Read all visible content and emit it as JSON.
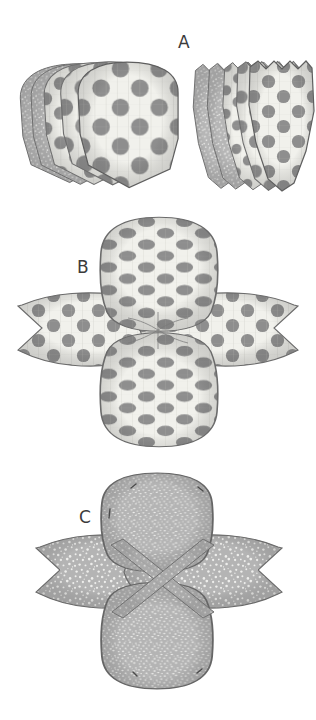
{
  "document": {
    "title": "Fabric Pattern Assembly Diagram",
    "type": "sewing instruction illustration",
    "background_color": "#ffffff",
    "width": 316,
    "height": 720
  },
  "palette": {
    "dot_gray": "#8e8e8e",
    "face_cream": "#f1f1ec",
    "face_outline": "#6f6f6f",
    "back_gray": "#b4b4b4",
    "speckle_white": "#f0f0ee",
    "strap_gray": "#a5a5a5",
    "label_ink": "#3b3b3b",
    "shadow": "#cfcfcf"
  },
  "steps": [
    {
      "id": "A",
      "label": "A",
      "label_x": 176,
      "label_y": 30,
      "description": "Two stacks of cut fabric pieces, fanned out",
      "groups": [
        {
          "name": "left-stack",
          "piece_shape": "rounded-top pointed-bottom panel",
          "count": 5,
          "visible_faces": [
            "speckled-back",
            "speckled-back",
            "polka-dot-front",
            "polka-dot-front",
            "polka-dot-front"
          ]
        },
        {
          "name": "right-stack",
          "piece_shape": "notched-top pointed-bottom petal",
          "count": 5,
          "visible_faces": [
            "speckled-back",
            "speckled-back",
            "polka-dot-front",
            "polka-dot-front",
            "polka-dot-front"
          ]
        }
      ]
    },
    {
      "id": "B",
      "label": "B",
      "label_x": 76,
      "label_y": 255,
      "description": "Four pieces joined into a cross / four-petal layout, polka-dot side up",
      "petals": [
        {
          "name": "top-petal",
          "face": "polka-dot-front",
          "shape": "rounded-rectangle"
        },
        {
          "name": "bottom-petal",
          "face": "polka-dot-front",
          "shape": "rounded-rectangle"
        },
        {
          "name": "left-petal",
          "face": "polka-dot-front",
          "shape": "notched-leaf"
        },
        {
          "name": "right-petal",
          "face": "polka-dot-front",
          "shape": "notched-leaf"
        }
      ]
    },
    {
      "id": "C",
      "label": "C",
      "label_x": 78,
      "label_y": 505,
      "description": "Same cross assembly flipped over, speckled back side up, with two crossed straps forming an X at the centre",
      "petals": [
        {
          "name": "top-petal",
          "face": "speckled-back",
          "shape": "rounded-rectangle"
        },
        {
          "name": "bottom-petal",
          "face": "speckled-back",
          "shape": "rounded-rectangle"
        },
        {
          "name": "left-petal",
          "face": "speckled-back",
          "shape": "notched-leaf"
        },
        {
          "name": "right-petal",
          "face": "speckled-back",
          "shape": "notched-leaf"
        }
      ],
      "straps": [
        {
          "name": "strap-nw-se",
          "orientation": "diagonal"
        },
        {
          "name": "strap-ne-sw",
          "orientation": "diagonal"
        }
      ]
    }
  ]
}
